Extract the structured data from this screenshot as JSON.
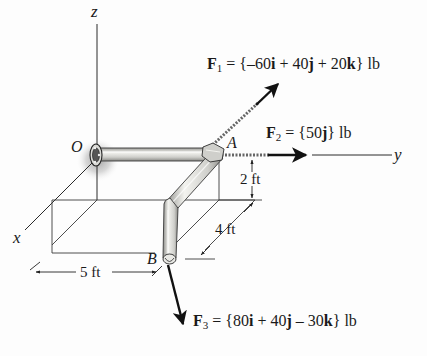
{
  "diagram": {
    "type": "3D statics pipe assembly with force vectors",
    "axes": {
      "x": "x",
      "y": "y",
      "z": "z"
    },
    "points": {
      "origin": "O",
      "a": "A",
      "b": "B"
    },
    "forces": [
      {
        "id": "F1",
        "symbol": "F",
        "subscript": "1",
        "equals": "=",
        "open": "{",
        "terms": [
          {
            "coef": "–60",
            "unit_vec": "i"
          },
          {
            "op": "+",
            "coef": "40",
            "unit_vec": "j"
          },
          {
            "op": "+",
            "coef": "20",
            "unit_vec": "k"
          }
        ],
        "close": "}",
        "unit": "lb",
        "applied_at": "A"
      },
      {
        "id": "F2",
        "symbol": "F",
        "subscript": "2",
        "equals": "=",
        "open": "{",
        "terms": [
          {
            "coef": "50",
            "unit_vec": "j"
          }
        ],
        "close": "}",
        "unit": "lb",
        "applied_at": "A"
      },
      {
        "id": "F3",
        "symbol": "F",
        "subscript": "3",
        "equals": "=",
        "open": "{",
        "terms": [
          {
            "coef": "80",
            "unit_vec": "i"
          },
          {
            "op": "+",
            "coef": "40",
            "unit_vec": "j"
          },
          {
            "op": "–",
            "coef": "30",
            "unit_vec": "k"
          }
        ],
        "close": "}",
        "unit": "lb",
        "applied_at": "B"
      }
    ],
    "dimensions": [
      {
        "id": "height",
        "label": "2 ft"
      },
      {
        "id": "depth",
        "label": "4 ft"
      },
      {
        "id": "width",
        "label": "5 ft"
      }
    ],
    "colors": {
      "line": "#2a2a2a",
      "pipe_fill": "#d4d4d0",
      "pipe_highlight": "#f2f2ee",
      "pipe_outline": "#3a3a3a",
      "hub_glow": "#9a9a9a",
      "background": "#fdfdfd"
    }
  }
}
